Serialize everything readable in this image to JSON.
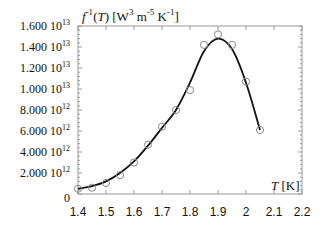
{
  "chart_data": {
    "type": "line",
    "title": "",
    "ylabel": "f⁻¹(T) [W³ m⁻⁵ K⁻¹]",
    "ylabel_parts": {
      "f": "f",
      "sup": "-1",
      "rest": "(T) [W",
      "w_sup": "3",
      "m": " m",
      "m_sup": "-5",
      "k": " K",
      "k_sup": "-1",
      "end": "]"
    },
    "xlabel": "T [K]",
    "xlabel_parts": {
      "t": "T",
      "unit": " [K]"
    },
    "xlim": [
      1.4,
      2.2
    ],
    "ylim": [
      0,
      16000000000000.0
    ],
    "x_ticks": [
      "1.4",
      "1.5",
      "1.6",
      "1.7",
      "1.8",
      "1.9",
      "2",
      "2.1",
      "2.2"
    ],
    "y_ticks": [
      {
        "mantissa": "0",
        "exp": ""
      },
      {
        "mantissa": "2.000 10",
        "exp": "12"
      },
      {
        "mantissa": "4.000 10",
        "exp": "12"
      },
      {
        "mantissa": "6.000 10",
        "exp": "12"
      },
      {
        "mantissa": "8.000 10",
        "exp": "12"
      },
      {
        "mantissa": "1.000 10",
        "exp": "13"
      },
      {
        "mantissa": "1.200 10",
        "exp": "13"
      },
      {
        "mantissa": "1.400 10",
        "exp": "13"
      },
      {
        "mantissa": "1.600 10",
        "exp": "13"
      }
    ],
    "grid": false,
    "legend": null,
    "series": [
      {
        "name": "measured",
        "style": "open-circle markers",
        "x": [
          1.4,
          1.45,
          1.5,
          1.55,
          1.6,
          1.65,
          1.7,
          1.75,
          1.8,
          1.85,
          1.9,
          1.95,
          2.0,
          2.05
        ],
        "values": [
          500000000000.0,
          600000000000.0,
          1050000000000.0,
          1800000000000.0,
          3000000000000.0,
          4700000000000.0,
          6400000000000.0,
          8000000000000.0,
          9900000000000.0,
          14200000000000.0,
          15200000000000.0,
          14200000000000.0,
          10700000000000.0,
          6100000000000.0
        ]
      },
      {
        "name": "fit",
        "style": "solid line",
        "x": [
          1.4,
          1.45,
          1.5,
          1.55,
          1.6,
          1.65,
          1.7,
          1.75,
          1.8,
          1.85,
          1.9,
          1.95,
          2.0,
          2.05
        ],
        "values": [
          500000000000.0,
          750000000000.0,
          1200000000000.0,
          2000000000000.0,
          3100000000000.0,
          4600000000000.0,
          6300000000000.0,
          8000000000000.0,
          10600000000000.0,
          13600000000000.0,
          14800000000000.0,
          13800000000000.0,
          10600000000000.0,
          6100000000000.0
        ]
      }
    ]
  },
  "colors": {
    "axis": "#9a9a9a",
    "line": "#111111",
    "marker": "#8a8a8a",
    "text": "#111111"
  }
}
